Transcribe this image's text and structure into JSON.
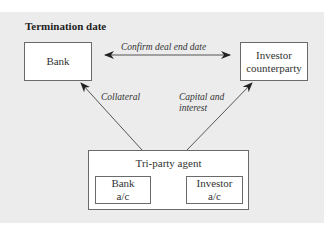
{
  "diagram": {
    "title": "Termination date",
    "nodes": {
      "bank": "Bank",
      "investor_line1": "Investor",
      "investor_line2": "counterparty",
      "tri_party": "Tri-party agent",
      "bank_ac_line1": "Bank",
      "bank_ac_line2": "a/c",
      "investor_ac_line1": "Investor",
      "investor_ac_line2": "a/c"
    },
    "edges": {
      "confirm": "Confirm deal end date",
      "collateral": "Collateral",
      "capital_line1": "Capital and",
      "capital_line2": "interest"
    },
    "colors": {
      "panel_background": "#ececec",
      "box_fill": "#ffffff",
      "line": "#555555"
    }
  }
}
